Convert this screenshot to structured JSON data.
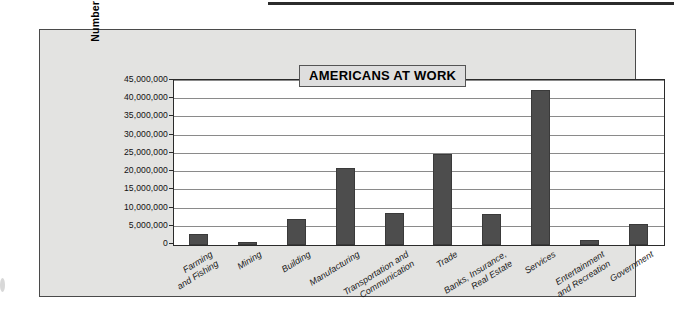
{
  "figure": {
    "title": "AMERICANS AT WORK"
  },
  "chart_data": {
    "type": "bar",
    "title": "AMERICANS AT WORK",
    "xlabel": "",
    "ylabel": "Number of People",
    "ylim": [
      0,
      45000000
    ],
    "ytick_step": 5000000,
    "grid": true,
    "legend": false,
    "orientation": "vertical",
    "bar_color": "#4d4d4d",
    "ytick_labels": [
      "45,000,000",
      "40,000,000",
      "35,000,000",
      "30,000,000",
      "25,000,000",
      "20,000,000",
      "15,000,000",
      "10,000,000",
      "5,000,000",
      "0"
    ],
    "categories": [
      "Farming and Fishing",
      "Mining",
      "Building",
      "Manufacturing",
      "Transportation and Communication",
      "Trade",
      "Banks, Insurance, Real Estate",
      "Services",
      "Entertainment and Recreation",
      "Government"
    ],
    "category_lines": [
      [
        "Farming",
        "and Fishing"
      ],
      [
        "Mining"
      ],
      [
        "Building"
      ],
      [
        "Manufacturing"
      ],
      [
        "Transportation and",
        "Communication"
      ],
      [
        "Trade"
      ],
      [
        "Banks, Insurance,",
        "Real Estate"
      ],
      [
        "Services"
      ],
      [
        "Entertainment",
        "and Recreation"
      ],
      [
        "Government"
      ]
    ],
    "values": [
      3000000,
      800000,
      7100000,
      21000000,
      8700000,
      25000000,
      8500000,
      42500000,
      1500000,
      5900000
    ]
  }
}
